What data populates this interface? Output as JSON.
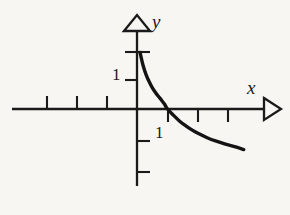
{
  "figure": {
    "background_color": "#f7f6f3",
    "ink_color": "#1a1a1a",
    "width": 290,
    "height": 215
  },
  "labels": {
    "y_axis": "y",
    "x_axis": "x",
    "y_unit_tick": "1",
    "x_unit_tick": "1"
  },
  "chart_data": {
    "type": "line",
    "title": "",
    "xlabel": "x",
    "ylabel": "y",
    "grid": false,
    "legend": null,
    "xlim": [
      -4.2,
      4.2
    ],
    "ylim": [
      -2.6,
      2.0
    ],
    "xticks": [
      -3,
      -2,
      -1,
      1,
      2,
      3
    ],
    "yticks": [
      1,
      2,
      -1,
      -2
    ],
    "xtick_labels": [
      "",
      "",
      "",
      "1",
      "",
      ""
    ],
    "ytick_labels": [
      "1",
      "",
      "",
      ""
    ],
    "x_axis_arrow": "open-triangle-right",
    "y_axis_arrow": "open-triangle-up",
    "series": [
      {
        "name": "curve",
        "x": [
          0.1,
          0.2,
          0.3,
          0.4,
          0.5,
          0.6,
          0.7,
          0.8,
          0.9,
          1.0,
          1.2,
          1.4,
          1.6,
          1.8,
          2.0,
          2.3,
          2.6,
          2.9,
          3.2,
          3.5
        ],
        "y": [
          1.95,
          1.5,
          1.18,
          0.94,
          0.74,
          0.58,
          0.44,
          0.31,
          0.17,
          0.0,
          -0.22,
          -0.42,
          -0.58,
          -0.72,
          -0.84,
          -0.99,
          -1.11,
          -1.21,
          -1.3,
          -1.4
        ]
      }
    ]
  }
}
